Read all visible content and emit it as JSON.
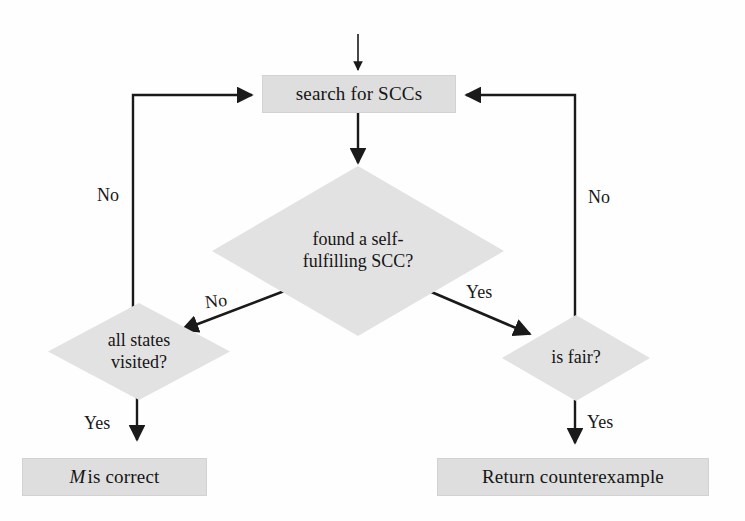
{
  "diagram": {
    "style": {
      "node_fill": "#dedede",
      "diamond_fill": "#e2e2e2",
      "edge_color": "#1a1a1a",
      "background": "#fefefe",
      "text_color": "#151515"
    },
    "nodes": [
      {
        "id": "search-for-sccs",
        "type": "process",
        "label": "search for SCCs"
      },
      {
        "id": "found-self-fulfilling-scc",
        "type": "decision",
        "label": "found a self-\nfulfilling SCC?"
      },
      {
        "id": "all-states-visited",
        "type": "decision",
        "label": "all states\nvisited?"
      },
      {
        "id": "is-fair",
        "type": "decision",
        "label": "is fair?"
      },
      {
        "id": "m-is-correct",
        "type": "terminal",
        "label_var": "M",
        "label_rest": " is correct"
      },
      {
        "id": "return-counterexample",
        "type": "terminal",
        "label": "Return counterexample"
      }
    ],
    "edge_labels": {
      "entry": "",
      "all_states_no": "No",
      "is_fair_no": "No",
      "scc_no": "No",
      "scc_yes": "Yes",
      "all_states_yes": "Yes",
      "is_fair_yes": "Yes"
    },
    "edges": [
      {
        "from": "start",
        "to": "search-for-sccs",
        "label": ""
      },
      {
        "from": "search-for-sccs",
        "to": "found-self-fulfilling-scc",
        "label": ""
      },
      {
        "from": "found-self-fulfilling-scc",
        "to": "all-states-visited",
        "label": "No"
      },
      {
        "from": "found-self-fulfilling-scc",
        "to": "is-fair",
        "label": "Yes"
      },
      {
        "from": "all-states-visited",
        "to": "search-for-sccs",
        "label": "No"
      },
      {
        "from": "all-states-visited",
        "to": "m-is-correct",
        "label": "Yes"
      },
      {
        "from": "is-fair",
        "to": "search-for-sccs",
        "label": "No"
      },
      {
        "from": "is-fair",
        "to": "return-counterexample",
        "label": "Yes"
      }
    ]
  }
}
